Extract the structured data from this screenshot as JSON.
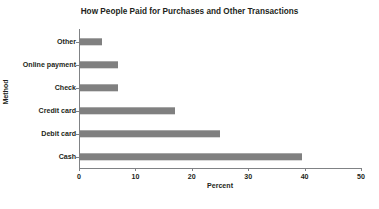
{
  "chart_data": {
    "type": "bar",
    "orientation": "horizontal",
    "title": "How People Paid for Purchases and Other Transactions",
    "xlabel": "Percent",
    "ylabel": "Method",
    "categories": [
      "Cash",
      "Debit card",
      "Credit card",
      "Check",
      "Online payment",
      "Other"
    ],
    "values": [
      39.5,
      25,
      17,
      7,
      7,
      4
    ],
    "xlim": [
      0,
      50
    ],
    "xticks": [
      0,
      10,
      20,
      30,
      40,
      50
    ],
    "xtick_labels": [
      "0",
      "10",
      "20",
      "30",
      "40",
      "50"
    ],
    "grid": false,
    "legend": false,
    "bar_color": "#808080",
    "axis_color": "#808285",
    "background_color": "#ffffff",
    "text_color": "#231f20"
  }
}
